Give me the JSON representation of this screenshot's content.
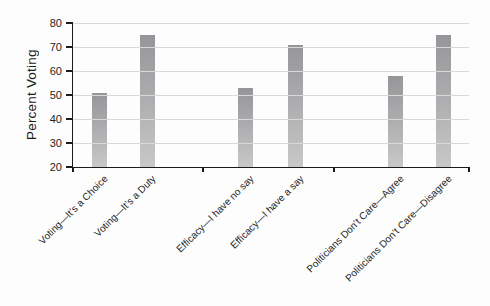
{
  "figure": {
    "background": "#fdfdfd"
  },
  "chart_data": {
    "type": "bar",
    "title": "",
    "xlabel": "",
    "ylabel": "Percent Voting",
    "categories": [
      "Voting—It’s a Choice",
      "Voting—It’s a Duty",
      "Efficacy—I have no say",
      "Efficacy—I have a say",
      "Politicians Don’t Care—Agree",
      "Politicians Don’t Care—Disagree"
    ],
    "values": [
      51,
      75,
      53,
      71,
      58,
      75
    ],
    "ylim": [
      20,
      80
    ],
    "yticks": [
      20,
      30,
      40,
      50,
      60,
      70,
      80
    ],
    "grid": "horizontal",
    "gridlines_over_bars": true,
    "legend": "none",
    "colors": {
      "bar_top": "#96969a",
      "bar_mid": "#aaaaac",
      "bar_bottom": "#c8c8c9",
      "grid": "#d9d9d9",
      "axis": "#1b1b1b",
      "text": "#1e1e1e"
    },
    "layout_hints": {
      "plot_px": {
        "left": 73,
        "top": 23,
        "right": 469,
        "bottom": 167
      },
      "bar_centers_px": [
        99,
        147,
        245,
        295,
        395,
        443
      ],
      "bar_width_px": 15,
      "group_tick_px": [
        73,
        203,
        334,
        469
      ],
      "x_label_anchor_y_px": 173
    }
  }
}
